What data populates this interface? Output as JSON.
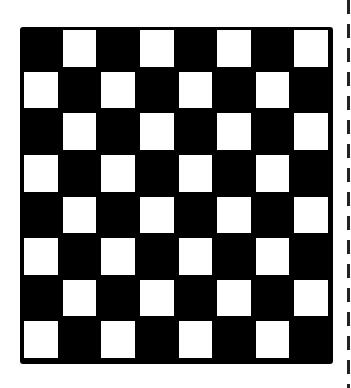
{
  "board": {
    "rows": 8,
    "cols": 8,
    "top_left_color": "black",
    "colors": {
      "dark": "#000000",
      "light": "#ffffff"
    }
  },
  "divider": {
    "style": "dashed",
    "color": "#222222"
  }
}
